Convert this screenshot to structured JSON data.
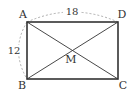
{
  "diagram": {
    "type": "rectangle-with-diagonals",
    "vertices": {
      "A": {
        "label": "A",
        "x": 27,
        "y": 22
      },
      "B": {
        "label": "B",
        "x": 27,
        "y": 79
      },
      "C": {
        "label": "C",
        "x": 118,
        "y": 79
      },
      "D": {
        "label": "D",
        "x": 118,
        "y": 22
      }
    },
    "intersection": {
      "label": "M",
      "x": 72,
      "y": 50
    },
    "measurements": {
      "top": {
        "label": "18",
        "segment": "AD"
      },
      "left": {
        "label": "12",
        "segment": "AB"
      }
    },
    "colors": {
      "stroke": "#333333",
      "dashed": "#999999",
      "background": "#ffffff"
    }
  }
}
